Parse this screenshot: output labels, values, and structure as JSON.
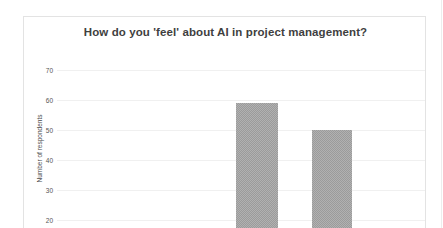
{
  "chart_data": {
    "type": "bar",
    "title": "How do you 'feel' about AI in project management?",
    "xlabel": "",
    "ylabel": "Number of respondents",
    "categories": [
      "Bar 1",
      "Bar 2"
    ],
    "values": [
      59,
      50
    ],
    "yticks": [
      70,
      60,
      50,
      40,
      30,
      20,
      10
    ],
    "ylim": [
      0,
      75
    ],
    "grid": "horizontal",
    "legend": "none",
    "bar_color": "#9b9b9b",
    "note": "Chart is cropped at the bottom of the screenshot; bars extend below the visible area and category labels are not visible."
  },
  "card": {
    "border_color": "#e3e3e3",
    "background": "#ffffff"
  },
  "title_color": "#3f3f3f",
  "tick_color": "#555555",
  "gridline_color": "#f0f0f0"
}
